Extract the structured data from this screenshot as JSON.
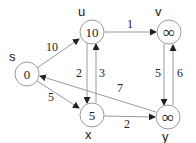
{
  "graph": {
    "title": "",
    "nodes": [
      {
        "id": "s",
        "label": "s",
        "value": "0",
        "cx": 27,
        "cy": 74,
        "label_x": 9,
        "label_y": 61
      },
      {
        "id": "u",
        "label": "u",
        "value": "10",
        "cx": 92,
        "cy": 32,
        "label_x": 78,
        "label_y": 16
      },
      {
        "id": "v",
        "label": "v",
        "value": "∞",
        "cx": 169,
        "cy": 32,
        "label_x": 155,
        "label_y": 16
      },
      {
        "id": "x",
        "label": "x",
        "value": "5",
        "cx": 92,
        "cy": 115,
        "label_x": 85,
        "label_y": 139
      },
      {
        "id": "y",
        "label": "y",
        "value": "∞",
        "cx": 168,
        "cy": 117,
        "label_x": 162,
        "label_y": 141
      }
    ],
    "edges": [
      {
        "from": "s",
        "to": "u",
        "weight": "10"
      },
      {
        "from": "s",
        "to": "x",
        "weight": "5"
      },
      {
        "from": "u",
        "to": "v",
        "weight": "1"
      },
      {
        "from": "u",
        "to": "x",
        "weight": "2"
      },
      {
        "from": "x",
        "to": "u",
        "weight": "3"
      },
      {
        "from": "x",
        "to": "y",
        "weight": "2"
      },
      {
        "from": "y",
        "to": "s",
        "weight": "7"
      },
      {
        "from": "v",
        "to": "y",
        "weight": "5"
      },
      {
        "from": "y",
        "to": "v",
        "weight": "6"
      }
    ]
  },
  "colors": {
    "stroke": "#9a9a9a",
    "text": "#222222",
    "arrow": "#222222",
    "background": "#ffffff"
  }
}
